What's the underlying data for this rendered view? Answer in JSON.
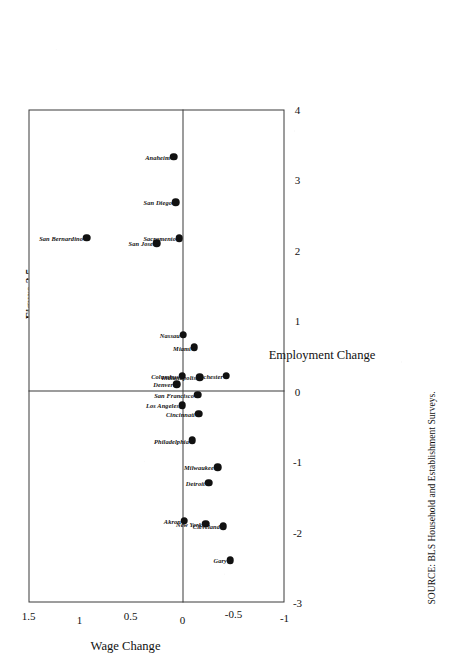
{
  "figure": {
    "title_line1": "Figure 2.5",
    "title_line2": "Average Percentage Wage and Employment Changes",
    "title_line3": "(relative to U.S.) 1973–1987",
    "source_note": "SOURCE: BLS Household and Establishment Surveys."
  },
  "chart_data": {
    "type": "scatter",
    "title": "Average Percentage Wage and Employment Changes (relative to U.S.) 1973–1987",
    "xlabel": "Employment Change",
    "ylabel": "Wage Change",
    "xlim": [
      -3,
      4
    ],
    "ylim": [
      -1,
      1.5
    ],
    "xticks": [
      "-3",
      "-2",
      "-1",
      "0",
      "1",
      "2",
      "3",
      "4"
    ],
    "yticks": [
      "-1",
      "-0.5",
      "0",
      "0.5",
      "1",
      "1.5"
    ],
    "grid": false,
    "legend": "none",
    "zero_lines": true,
    "points": [
      {
        "label": "San Bernardino",
        "x": 2.18,
        "y": 0.93,
        "label_pos": "left"
      },
      {
        "label": "San Jose",
        "x": 2.1,
        "y": 0.25,
        "label_pos": "left"
      },
      {
        "label": "Sacramento",
        "x": 2.17,
        "y": 0.03,
        "label_pos": "left"
      },
      {
        "label": "San Diego",
        "x": 2.68,
        "y": 0.06,
        "label_pos": "left"
      },
      {
        "label": "Anaheim",
        "x": 3.33,
        "y": 0.08,
        "label_pos": "left"
      },
      {
        "label": "Nassau",
        "x": 0.8,
        "y": -0.01,
        "label_pos": "left"
      },
      {
        "label": "Miami",
        "x": 0.62,
        "y": -0.12,
        "label_pos": "left"
      },
      {
        "label": "Denver",
        "x": 0.1,
        "y": 0.05,
        "label_pos": "left"
      },
      {
        "label": "Columbus",
        "x": 0.22,
        "y": 0.0,
        "label_pos": "left"
      },
      {
        "label": "Los Angeles",
        "x": -0.2,
        "y": 0.0,
        "label_pos": "left"
      },
      {
        "label": "San Francisco",
        "x": -0.05,
        "y": -0.15,
        "label_pos": "left"
      },
      {
        "label": "Cincinnati",
        "x": -0.32,
        "y": -0.16,
        "label_pos": "left"
      },
      {
        "label": "Indianapolis",
        "x": 0.2,
        "y": -0.17,
        "label_pos": "left"
      },
      {
        "label": "Rochester",
        "x": 0.22,
        "y": -0.43,
        "label_pos": "left"
      },
      {
        "label": "Philadelphia",
        "x": -0.7,
        "y": -0.1,
        "label_pos": "left"
      },
      {
        "label": "Detroit",
        "x": -1.3,
        "y": -0.26,
        "label_pos": "left"
      },
      {
        "label": "Milwaukee",
        "x": -1.08,
        "y": -0.35,
        "label_pos": "left"
      },
      {
        "label": "Akron",
        "x": -1.84,
        "y": -0.02,
        "label_pos": "left"
      },
      {
        "label": "New York",
        "x": -1.88,
        "y": -0.23,
        "label_pos": "left"
      },
      {
        "label": "Cleveland",
        "x": -1.92,
        "y": -0.4,
        "label_pos": "left"
      },
      {
        "label": "Gary",
        "x": -2.4,
        "y": -0.47,
        "label_pos": "left"
      }
    ]
  }
}
